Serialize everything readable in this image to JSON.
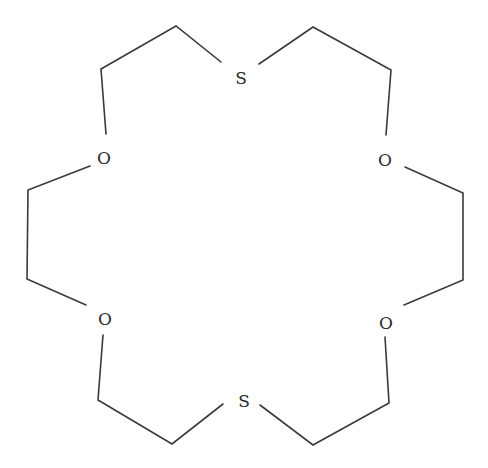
{
  "diagram": {
    "type": "chemical-structure",
    "colors": {
      "bond": "#3a3a3a",
      "atom_label": "#2a2a2a",
      "background": "#ffffff"
    },
    "atoms": [
      {
        "id": "s_top",
        "label": "S",
        "x": 241,
        "y": 79
      },
      {
        "id": "o_upper_left",
        "label": "O",
        "x": 104,
        "y": 159
      },
      {
        "id": "o_upper_right",
        "label": "O",
        "x": 385,
        "y": 161
      },
      {
        "id": "o_lower_left",
        "label": "O",
        "x": 105,
        "y": 320
      },
      {
        "id": "o_lower_right",
        "label": "O",
        "x": 386,
        "y": 324
      },
      {
        "id": "s_bottom",
        "label": "S",
        "x": 244,
        "y": 402
      }
    ],
    "bonds_polyline": [
      [
        [
          221,
          62
        ],
        [
          176,
          26
        ],
        [
          101,
          69
        ],
        [
          106,
          134
        ]
      ],
      [
        [
          259,
          64
        ],
        [
          313,
          27
        ],
        [
          391,
          70
        ],
        [
          386,
          135
        ]
      ],
      [
        [
          90,
          166
        ],
        [
          28,
          190
        ],
        [
          27,
          279
        ],
        [
          86,
          305
        ]
      ],
      [
        [
          405,
          167
        ],
        [
          463,
          193
        ],
        [
          463,
          280
        ],
        [
          404,
          305
        ]
      ],
      [
        [
          103,
          335
        ],
        [
          98,
          400
        ],
        [
          172,
          444
        ],
        [
          223,
          404
        ]
      ],
      [
        [
          385,
          337
        ],
        [
          389,
          403
        ],
        [
          313,
          445
        ],
        [
          260,
          405
        ]
      ]
    ]
  }
}
